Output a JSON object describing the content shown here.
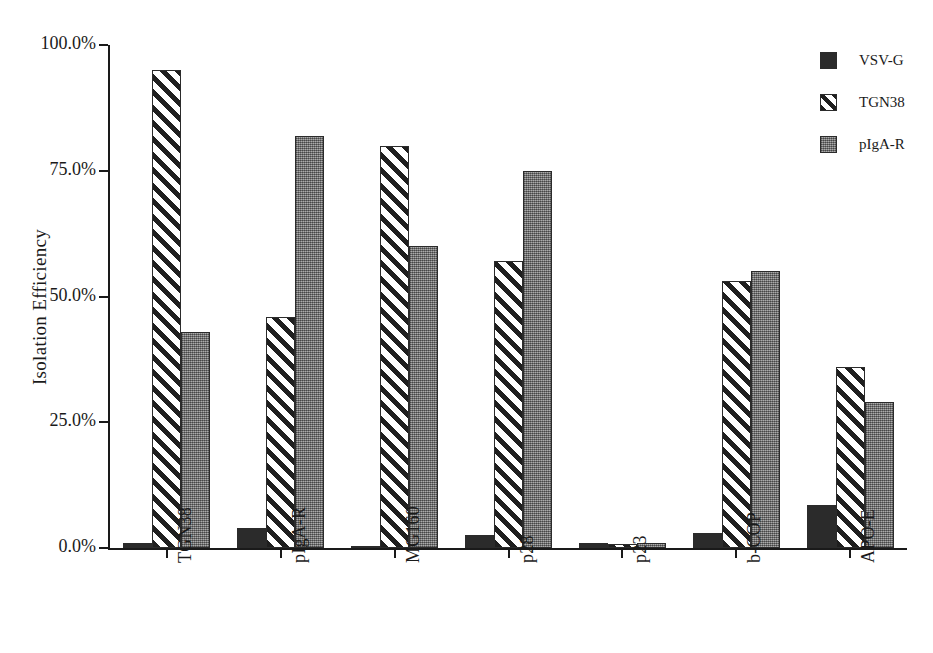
{
  "chart_data": {
    "type": "bar",
    "title": "",
    "xlabel": "",
    "ylabel": "Isolation Efficiency",
    "ylim": [
      0,
      100
    ],
    "yunit": "%",
    "grid": false,
    "legend_position": "top-right",
    "categories": [
      "TGN38",
      "pIgA-R",
      "MG160",
      "p28",
      "p23",
      "b-COP",
      "APO-E"
    ],
    "ytick_labels": [
      "100.0%",
      "75.0%",
      "50.0%",
      "25.0%",
      "0.0%"
    ],
    "ytick_values": [
      100,
      75,
      50,
      25,
      0
    ],
    "series": [
      {
        "name": "VSV-G",
        "key": "vsvg",
        "pattern": "solid-black",
        "color": "#2b2b2b",
        "values": [
          1.0,
          4.0,
          0.5,
          2.5,
          1.0,
          3.0,
          8.5
        ]
      },
      {
        "name": "TGN38",
        "key": "tgn38",
        "pattern": "diagonal-stripes",
        "color": "#1f1f1f",
        "values": [
          95.0,
          46.0,
          80.0,
          57.0,
          0.8,
          53.0,
          36.0
        ]
      },
      {
        "name": "pIgA-R",
        "key": "pigar",
        "pattern": "speckled-gray",
        "color": "#8a8a8a",
        "values": [
          43.0,
          82.0,
          60.0,
          75.0,
          1.0,
          55.0,
          29.0
        ]
      }
    ]
  },
  "legend": {
    "items": [
      {
        "label": "VSV-G",
        "key": "vsvg"
      },
      {
        "label": "TGN38",
        "key": "tgn38"
      },
      {
        "label": "pIgA-R",
        "key": "pigar"
      }
    ]
  }
}
